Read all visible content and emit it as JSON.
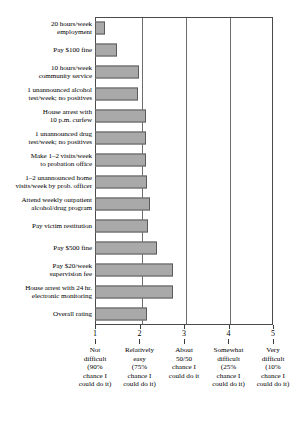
{
  "chart_data": {
    "type": "bar",
    "orientation": "horizontal",
    "title": "",
    "subtitle": "",
    "xlabel": "",
    "ylabel": "",
    "xlim": [
      1,
      5
    ],
    "grid": true,
    "legend": null,
    "bar_color": "#a9a9a9",
    "bar_border_color": "#5b5b5b",
    "frame_color": "#4a4a4a",
    "categories": [
      "20 hours/week\nemployment",
      "Pay $100 fine",
      "10 hours/week\ncommunity service",
      "1 unannounced alcohol\ntest/week; no positives",
      "House arrest with\n10 p.m. curfew",
      "1 unannounced drug\ntest/week; no positives",
      "Make 1–2 visits/week\nto probation office",
      "1–2 unannounced home\nvisits/week by prob. officer",
      "Attend weekly outpatient\nalcohol/drug program",
      "Pay victim restitution",
      "Pay $500 fine",
      "Pay $20/week\nsupervision fee",
      "House arrest with 24 hr.\nelectronic monitoring",
      "Overall rating"
    ],
    "values": [
      1.22,
      1.5,
      1.99,
      1.97,
      2.15,
      2.15,
      2.14,
      2.16,
      2.24,
      2.19,
      2.39,
      2.75,
      2.76,
      2.17
    ],
    "xticks": [
      {
        "value": 1,
        "label": "1",
        "description": "Not\ndifficult\n(90%\nchance I\ncould do it)"
      },
      {
        "value": 2,
        "label": "2",
        "description": "Relatively\neasy\n(75%\nchance I\ncould do it)"
      },
      {
        "value": 3,
        "label": "3",
        "description": "About\n50/50\nchance I\ncould do it"
      },
      {
        "value": 4,
        "label": "4",
        "description": "Somewhat\ndifficult\n(25%\nchance I\ncould do it)"
      },
      {
        "value": 5,
        "label": "5",
        "description": "Very\ndifficult\n(10%\nchance I\ncould do it)"
      }
    ]
  }
}
